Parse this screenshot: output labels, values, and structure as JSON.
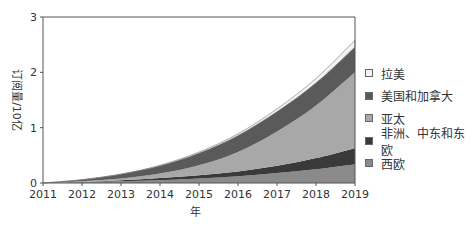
{
  "chart_data": {
    "type": "area",
    "stacked": true,
    "title": "",
    "xlabel": "年",
    "ylabel": "订阅量/10亿",
    "x": [
      2011,
      2012,
      2013,
      2014,
      2015,
      2016,
      2017,
      2018,
      2019
    ],
    "xticks": [
      "2011",
      "2012",
      "2013",
      "2014",
      "2015",
      "2016",
      "2017",
      "2018",
      "2019"
    ],
    "yticks": [
      "0",
      "1",
      "2",
      "3"
    ],
    "ylim": [
      0,
      3
    ],
    "xlim": [
      2011,
      2019
    ],
    "grid": false,
    "legend_position": "right",
    "series": [
      {
        "name": "西欧",
        "color": "#8a8a8a",
        "values": [
          0.0,
          0.01,
          0.03,
          0.05,
          0.08,
          0.12,
          0.18,
          0.25,
          0.34
        ]
      },
      {
        "name": "非洲、中东和东欧",
        "color": "#3a3a3a",
        "values": [
          0.0,
          0.01,
          0.02,
          0.04,
          0.06,
          0.09,
          0.13,
          0.2,
          0.29
        ]
      },
      {
        "name": "亚太",
        "color": "#a8a8a8",
        "values": [
          0.0,
          0.01,
          0.03,
          0.08,
          0.18,
          0.35,
          0.62,
          0.95,
          1.37
        ]
      },
      {
        "name": "美国和加拿大",
        "color": "#5a5a5a",
        "values": [
          0.0,
          0.03,
          0.08,
          0.14,
          0.22,
          0.3,
          0.36,
          0.41,
          0.46
        ]
      },
      {
        "name": "拉美",
        "color": "#f2f2f2",
        "values": [
          0.0,
          0.0,
          0.0,
          0.01,
          0.02,
          0.03,
          0.05,
          0.08,
          0.12
        ]
      }
    ]
  },
  "legend": {
    "items": [
      {
        "label": "拉美",
        "color": "#f2f2f2"
      },
      {
        "label": "美国和加拿大",
        "color": "#5a5a5a"
      },
      {
        "label": "亚太",
        "color": "#a8a8a8"
      },
      {
        "label": "非洲、中东和东欧",
        "color": "#3a3a3a"
      },
      {
        "label": "西欧",
        "color": "#8a8a8a"
      }
    ]
  },
  "axes": {
    "xlabel": "年",
    "ylabel": "订阅量/10亿"
  }
}
